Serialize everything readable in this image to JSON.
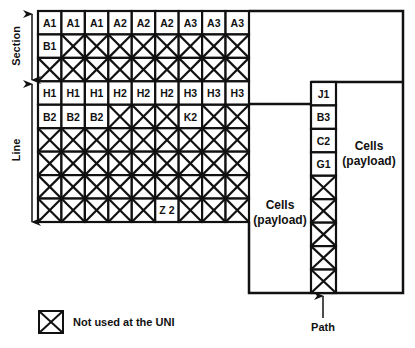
{
  "diagram": {
    "columns": 9,
    "rows": [
      [
        "A1",
        "A1",
        "A1",
        "A2",
        "A2",
        "A2",
        "A3",
        "A3",
        "A3"
      ],
      [
        "B1",
        null,
        null,
        null,
        null,
        null,
        null,
        null,
        null
      ],
      [
        null,
        null,
        null,
        null,
        null,
        null,
        null,
        null,
        null
      ],
      [
        "H1",
        "H1",
        "H1",
        "H2",
        "H2",
        "H2",
        "H3",
        "H3",
        "H3"
      ],
      [
        "B2",
        "B2",
        "B2",
        null,
        null,
        null,
        "K2",
        null,
        null
      ],
      [
        null,
        null,
        null,
        null,
        null,
        null,
        null,
        null,
        null
      ],
      [
        null,
        null,
        null,
        null,
        null,
        null,
        null,
        null,
        null
      ],
      [
        null,
        null,
        null,
        null,
        null,
        null,
        null,
        null,
        null
      ],
      [
        null,
        null,
        null,
        null,
        null,
        "Z 2",
        null,
        null,
        null
      ]
    ],
    "section_label": "Section",
    "line_label": "Line",
    "path_column": [
      "J1",
      "B3",
      "C2",
      "G1",
      null,
      null,
      null,
      null,
      null
    ],
    "payload_left": [
      "Cells",
      "(payload)"
    ],
    "payload_right": [
      "Cells",
      "(payload)"
    ],
    "path_label": "Path",
    "legend_label": "Not used at the UNI"
  }
}
